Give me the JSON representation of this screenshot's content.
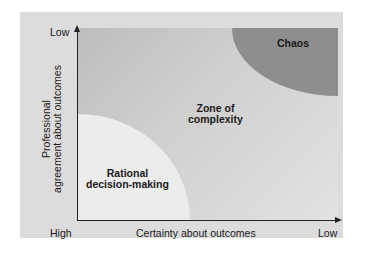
{
  "diagram": {
    "type": "quadrant-zones",
    "y_axis": {
      "title_line1": "Professional",
      "title_line2": "agreement about outcomes",
      "top_label": "Low",
      "bottom_label": "High"
    },
    "x_axis": {
      "title": "Certainty about outcomes",
      "left_label": "High",
      "right_label": "Low"
    },
    "zones": [
      {
        "id": "rational",
        "label_line1": "Rational",
        "label_line2": "decision-making",
        "color": "#ececec"
      },
      {
        "id": "complexity",
        "label_line1": "Zone of",
        "label_line2": "complexity",
        "color": "#c8c8c8"
      },
      {
        "id": "chaos",
        "label_line1": "Chaos",
        "color": "#8e8e8e"
      }
    ],
    "colors": {
      "panel": "#dcdcdc",
      "axis": "#222222"
    }
  }
}
